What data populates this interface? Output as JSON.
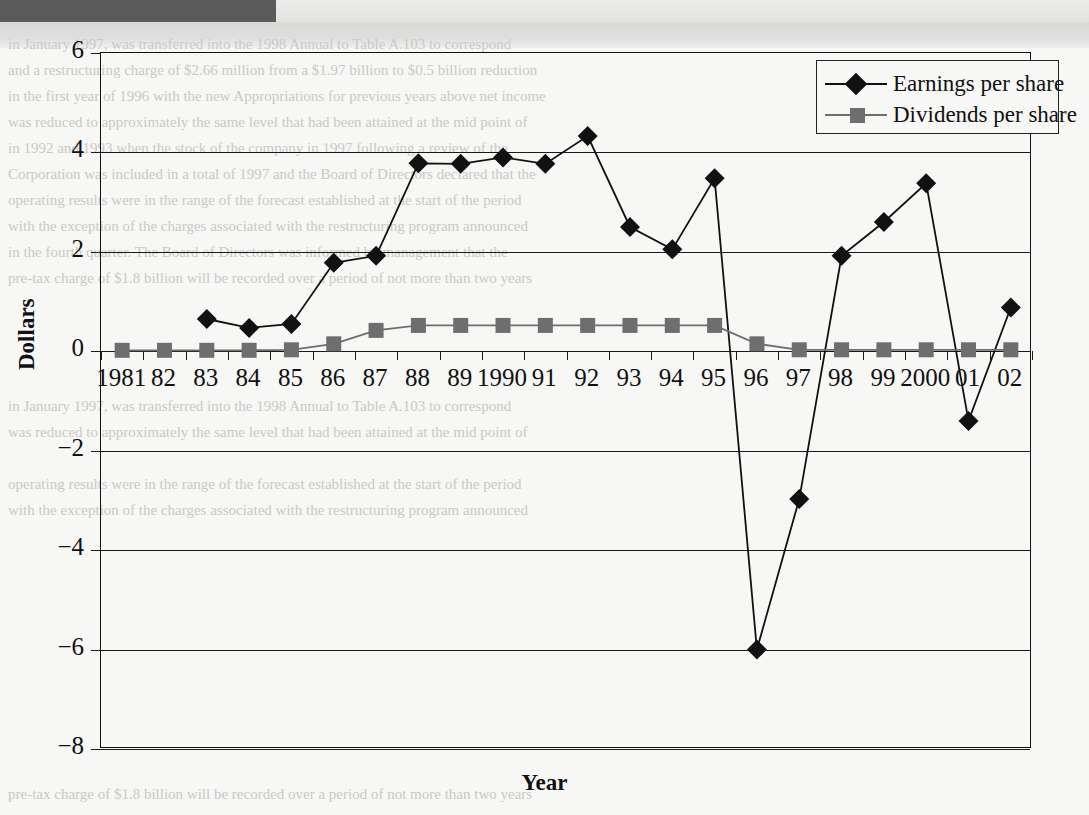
{
  "chart_data": {
    "type": "line",
    "title": "",
    "xlabel": "Year",
    "ylabel": "Dollars",
    "ylim": [
      -8,
      6
    ],
    "yticks": [
      6,
      4,
      2,
      0,
      -2,
      -4,
      -6,
      -8
    ],
    "ytick_labels": [
      "6",
      "4",
      "2",
      "0",
      "−2",
      "−4",
      "−6",
      "−8"
    ],
    "grid": true,
    "legend_position": "top-right",
    "categories": [
      "1981",
      "82",
      "83",
      "84",
      "85",
      "86",
      "87",
      "88",
      "89",
      "1990",
      "91",
      "92",
      "93",
      "94",
      "95",
      "96",
      "97",
      "98",
      "99",
      "2000",
      "01",
      "02"
    ],
    "x": [
      1981,
      1982,
      1983,
      1984,
      1985,
      1986,
      1987,
      1988,
      1989,
      1990,
      1991,
      1992,
      1993,
      1994,
      1995,
      1996,
      1997,
      1998,
      1999,
      2000,
      2001,
      2002
    ],
    "series": [
      {
        "name": "Earnings per share",
        "marker": "diamond",
        "color": "#111111",
        "values": [
          null,
          null,
          0.65,
          0.47,
          0.55,
          1.78,
          1.92,
          3.78,
          3.77,
          3.9,
          3.77,
          4.33,
          2.5,
          2.05,
          3.48,
          -6.0,
          -2.97,
          1.92,
          2.6,
          3.38,
          -1.4,
          0.88
        ]
      },
      {
        "name": "Dividends per share",
        "marker": "square",
        "color": "#6e6e6e",
        "values": [
          0.02,
          0.02,
          0.02,
          0.02,
          0.03,
          0.15,
          0.42,
          0.52,
          0.52,
          0.52,
          0.52,
          0.52,
          0.52,
          0.52,
          0.52,
          0.15,
          0.03,
          0.03,
          0.03,
          0.03,
          0.03,
          0.03
        ]
      }
    ]
  },
  "legend": {
    "items": [
      {
        "label": "Earnings per share"
      },
      {
        "label": "Dividends per share"
      }
    ]
  },
  "axis_titles": {
    "y": "Dollars",
    "x": "Year"
  },
  "scan_artifacts": {
    "ghost_lines": [
      "in January 1997, was transferred into the 1998 Annual to Table A.103 to correspond",
      "and a restructuring charge of $2.66 million from a $1.97 billion to $0.5 billion reduction",
      "in the first year of 1996 with the new Appropriations for previous years above net income",
      "was reduced to approximately the same level that had been attained at the mid point of",
      "in 1992 and 1993 when the stock of the company in 1997 following a review of the",
      "Corporation was included in a total of 1997 and the Board of Directors declared that the",
      "operating results were in the range of the forecast established at the start of the period",
      "with the exception of the charges associated with the restructuring program announced",
      "in the fourth quarter. The Board of Directors was informed by management that the",
      "pre-tax charge of $1.8 billion will be recorded over a period of not more than two years"
    ]
  }
}
